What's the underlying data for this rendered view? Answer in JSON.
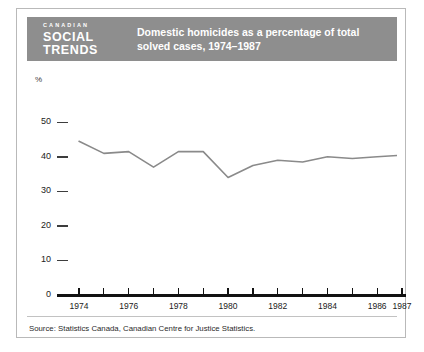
{
  "header": {
    "brand_line1": "CANADIAN",
    "brand_line2": "SOCIAL",
    "brand_line3": "TRENDS",
    "title": "Domestic homicides as a percentage of total solved cases, 1974–1987",
    "background_color": "#8e8e8e",
    "text_color": "#ffffff"
  },
  "footer": {
    "source": "Source: Statistics Canada, Canadian Centre for Justice Statistics."
  },
  "chart_data": {
    "type": "line",
    "title": "Domestic homicides as a percentage of total solved cases, 1974–1987",
    "xlabel": "",
    "ylabel": "%",
    "ylim": [
      0,
      55
    ],
    "yticks": [
      0,
      10,
      20,
      30,
      40,
      50
    ],
    "ytick_labels": [
      "0",
      "10",
      "20",
      "30",
      "40",
      "50"
    ],
    "grid": false,
    "legend": "none",
    "line_color": "#8a8a8a",
    "axis_color": "#111111",
    "x": [
      1974,
      1975,
      1976,
      1977,
      1978,
      1979,
      1980,
      1981,
      1982,
      1983,
      1984,
      1985,
      1986,
      1987
    ],
    "xtick_labels": [
      "1974",
      "",
      "1976",
      "",
      "1978",
      "",
      "1980",
      "",
      "1982",
      "",
      "1984",
      "",
      "1986",
      "1987"
    ],
    "values": [
      44.5,
      41.0,
      41.5,
      37.0,
      41.5,
      41.5,
      34.0,
      37.5,
      39.0,
      38.5,
      40.0,
      39.5,
      40.0,
      40.5
    ],
    "series": [
      {
        "name": "Domestic homicides as % of total solved cases",
        "values": [
          44.5,
          41.0,
          41.5,
          37.0,
          41.5,
          41.5,
          34.0,
          37.5,
          39.0,
          38.5,
          40.0,
          39.5,
          40.0,
          40.5
        ]
      }
    ]
  }
}
